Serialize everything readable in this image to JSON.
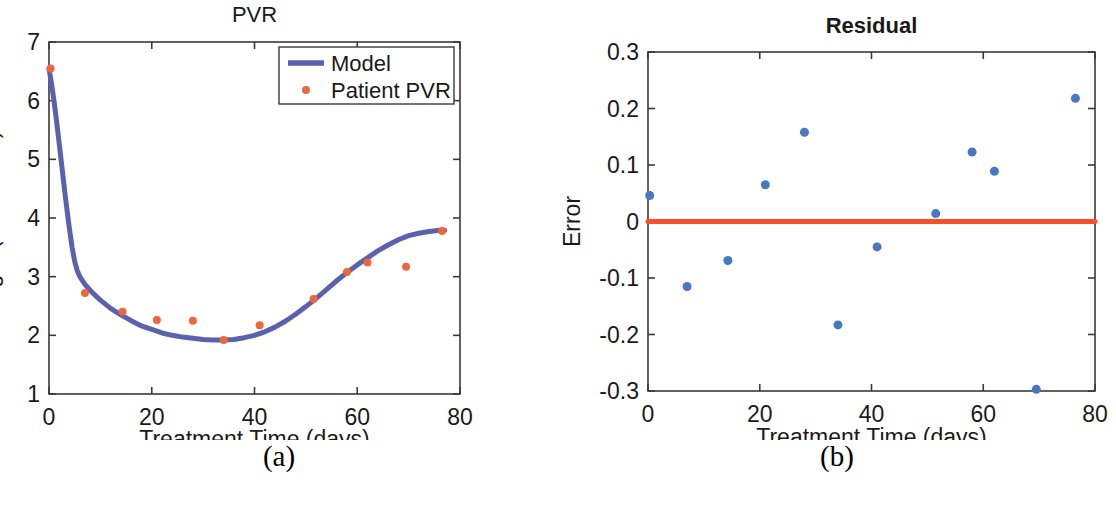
{
  "figure": {
    "panels": [
      {
        "caption": "(a)",
        "title": "PVR",
        "title_bold": false,
        "xlabel": "Treatment Time (days)",
        "ylabel": "log10(Viral Load)",
        "xticks": [
          "0",
          "20",
          "40",
          "60",
          "80"
        ],
        "yticks": [
          "1",
          "2",
          "3",
          "4",
          "5",
          "6",
          "7"
        ],
        "legend": [
          {
            "label": "Model",
            "marker": "line",
            "color": "#5b62ad"
          },
          {
            "label": "Patient PVR",
            "marker": "dot",
            "color": "#f0663c"
          }
        ]
      },
      {
        "caption": "(b)",
        "title": "Residual",
        "title_bold": true,
        "xlabel": "Treatment Time (days)",
        "ylabel": "Error",
        "xticks": [
          "0",
          "20",
          "40",
          "60",
          "80"
        ],
        "yticks": [
          "-0.3",
          "-0.2",
          "-0.1",
          "0",
          "0.1",
          "0.2",
          "0.3"
        ]
      }
    ]
  },
  "chart_data": [
    {
      "type": "line",
      "title": "PVR",
      "xlabel": "Treatment Time (days)",
      "ylabel": "log10(Viral Load)",
      "xlim": [
        0,
        80
      ],
      "ylim": [
        1,
        7
      ],
      "xtick_values": [
        0,
        20,
        40,
        60,
        80
      ],
      "ytick_values": [
        1,
        2,
        3,
        4,
        5,
        6,
        7
      ],
      "grid": false,
      "legend_position": "top-right",
      "series": [
        {
          "name": "Model",
          "type": "line",
          "color": "#5b62ad",
          "linewidth": 5,
          "x": [
            0,
            0.5,
            1,
            1.5,
            2,
            2.5,
            3,
            3.5,
            4,
            4.5,
            5,
            5.5,
            6,
            7,
            8,
            9,
            10,
            12,
            14,
            16,
            18,
            20,
            22,
            24,
            26,
            28,
            30,
            32,
            34,
            36,
            38,
            40,
            42,
            44,
            46,
            48,
            50,
            52,
            54,
            56,
            58,
            60,
            62,
            64,
            66,
            68,
            70,
            72,
            74,
            76,
            77
          ],
          "y": [
            6.55,
            6.28,
            5.98,
            5.63,
            5.26,
            4.88,
            4.5,
            4.14,
            3.8,
            3.5,
            3.26,
            3.1,
            3.0,
            2.87,
            2.77,
            2.68,
            2.6,
            2.46,
            2.35,
            2.25,
            2.16,
            2.1,
            2.04,
            2.0,
            1.97,
            1.95,
            1.93,
            1.92,
            1.92,
            1.93,
            1.96,
            2.0,
            2.06,
            2.14,
            2.24,
            2.36,
            2.49,
            2.63,
            2.78,
            2.93,
            3.07,
            3.2,
            3.32,
            3.44,
            3.54,
            3.63,
            3.7,
            3.74,
            3.77,
            3.79,
            3.79
          ]
        },
        {
          "name": "Patient PVR",
          "type": "scatter",
          "color": "#f0663c",
          "markersize": 8,
          "x": [
            0.3,
            7,
            14.3,
            21,
            28,
            34,
            41,
            51.5,
            58,
            62,
            69.5,
            76.5
          ],
          "y": [
            6.55,
            2.72,
            2.4,
            2.26,
            2.25,
            1.92,
            2.17,
            2.62,
            3.08,
            3.24,
            3.17,
            3.78
          ]
        }
      ]
    },
    {
      "type": "scatter",
      "title": "Residual",
      "xlabel": "Treatment Time (days)",
      "ylabel": "Error",
      "xlim": [
        0,
        80
      ],
      "ylim": [
        -0.3,
        0.3
      ],
      "xtick_values": [
        0,
        20,
        40,
        60,
        80
      ],
      "ytick_values": [
        -0.3,
        -0.2,
        -0.1,
        0,
        0.1,
        0.2,
        0.3
      ],
      "grid": false,
      "legend_position": "none",
      "series": [
        {
          "name": "Zero line",
          "type": "line",
          "color": "#f4502a",
          "linewidth": 5,
          "x": [
            0,
            80
          ],
          "y": [
            0,
            0
          ]
        },
        {
          "name": "Error",
          "type": "scatter",
          "color": "#4878c0",
          "markersize": 9,
          "x": [
            0.3,
            7,
            14.3,
            21,
            28,
            34,
            41,
            51.5,
            58,
            62,
            69.5,
            76.5
          ],
          "y": [
            0.046,
            -0.115,
            -0.069,
            0.065,
            0.158,
            -0.183,
            -0.045,
            0.014,
            0.123,
            0.089,
            -0.297,
            0.218
          ]
        }
      ]
    }
  ]
}
